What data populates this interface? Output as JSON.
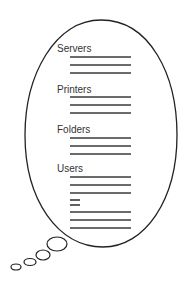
{
  "diagram": {
    "type": "thought-bubble",
    "stroke_color": "#222222",
    "line_color": "#3a3a3a",
    "sections": [
      {
        "label": "Servers",
        "label_y": 52,
        "lines": [
          {
            "y": 57,
            "w": 61
          },
          {
            "y": 65,
            "w": 61
          },
          {
            "y": 73,
            "w": 61
          }
        ]
      },
      {
        "label": "Printers",
        "label_y": 93,
        "lines": [
          {
            "y": 97,
            "w": 61
          },
          {
            "y": 105,
            "w": 61
          },
          {
            "y": 113,
            "w": 61
          }
        ]
      },
      {
        "label": "Folders",
        "label_y": 133,
        "lines": [
          {
            "y": 138,
            "w": 61
          },
          {
            "y": 146,
            "w": 61
          },
          {
            "y": 154,
            "w": 61
          }
        ]
      },
      {
        "label": "Users",
        "label_y": 172,
        "lines": [
          {
            "y": 177,
            "w": 61
          },
          {
            "y": 185,
            "w": 61
          },
          {
            "y": 193,
            "w": 61
          },
          {
            "y": 200,
            "w": 10
          },
          {
            "y": 205,
            "w": 10
          },
          {
            "y": 212,
            "w": 61
          },
          {
            "y": 220,
            "w": 61
          },
          {
            "y": 228,
            "w": 61
          }
        ]
      }
    ]
  }
}
